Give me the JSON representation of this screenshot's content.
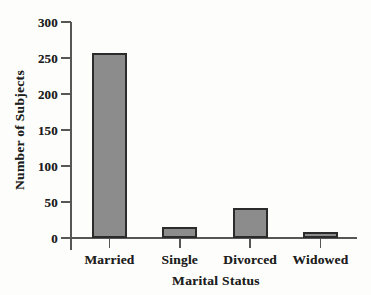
{
  "figure": {
    "background": "#fdfdfb",
    "text_color": "#1e1e1e"
  },
  "chart_data": {
    "type": "bar",
    "categories": [
      "Married",
      "Single",
      "Divorced",
      "Widowed"
    ],
    "values": [
      257,
      15,
      42,
      8
    ],
    "xlabel": "Marital Status",
    "ylabel": "Number of Subjects",
    "ylim": [
      0,
      300
    ],
    "yticks": [
      0,
      50,
      100,
      150,
      200,
      250,
      300
    ],
    "grid": false,
    "legend": "none",
    "bar_fill": "#8c8c8c",
    "bar_border": "#2b2b2b",
    "axis_color": "#565656"
  }
}
